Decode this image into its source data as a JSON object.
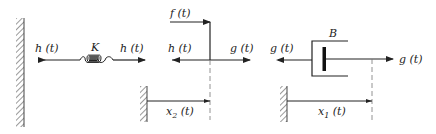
{
  "diagram": {
    "type": "mechanical-free-body",
    "colors": {
      "ink": "#222222",
      "hatch": "#555555",
      "dashed": "#777777",
      "background": "#ffffff"
    },
    "spring": {
      "parameter_label": "K",
      "left_force_label": "h (t)",
      "right_force_label": "h (t)"
    },
    "mass_node": {
      "applied_force_label": "f (t)",
      "left_force_label": "h (t)",
      "right_force_label": "g (t)",
      "displacement_label": "x",
      "displacement_subscript": "2",
      "displacement_suffix": " (t)"
    },
    "damper": {
      "parameter_label": "B",
      "left_force_label": "g (t)",
      "right_force_label": "g (t)",
      "displacement_label": "x",
      "displacement_subscript": "1",
      "displacement_suffix": " (t)"
    }
  }
}
